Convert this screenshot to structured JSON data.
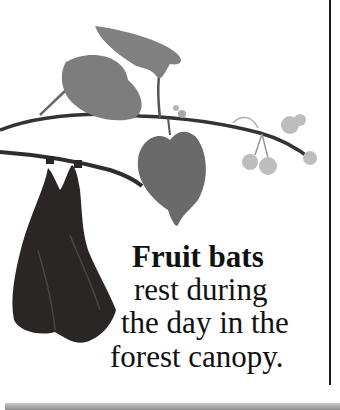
{
  "caption": {
    "title": "Fruit bats",
    "lines": [
      "rest during",
      "the day in the",
      "forest canopy."
    ]
  },
  "illustration": {
    "subject": "fruit bat hanging upside down from a leafy branch",
    "colors": {
      "leaf": "#7a7a7a",
      "leaf_dark": "#5e5e5e",
      "branch": "#2e2e2e",
      "bat": "#2a2626",
      "flower": "#bdbdbd"
    }
  },
  "colors": {
    "page_background": "#ffffff",
    "text": "#111111",
    "rule": "#1a1a1a",
    "bottom_band": "#9a9a9a"
  }
}
